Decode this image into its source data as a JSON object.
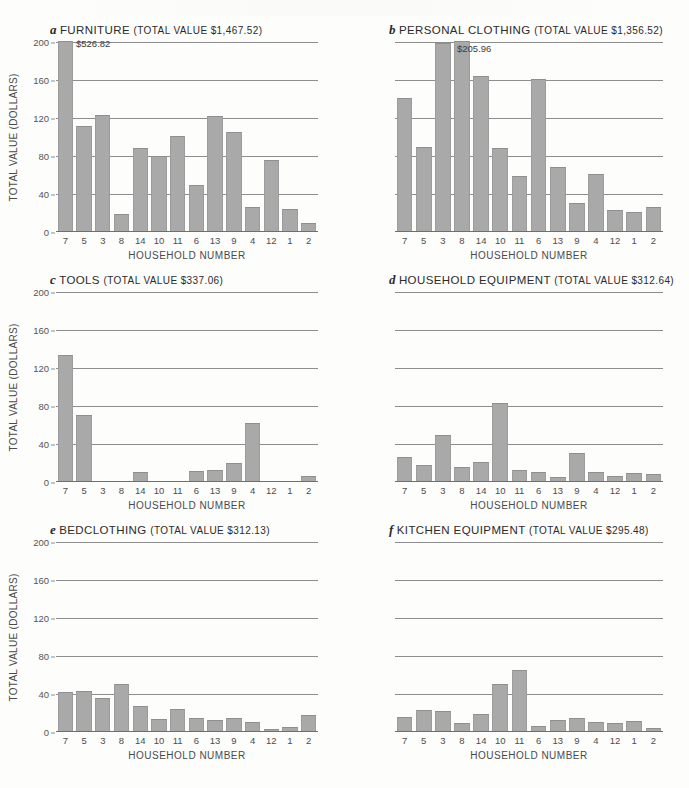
{
  "figure": {
    "x_axis_label": "HOUSEHOLD NUMBER",
    "y_axis_label": "TOTAL VALUE (DOLLARS)",
    "households": [
      "7",
      "5",
      "3",
      "8",
      "14",
      "10",
      "11",
      "6",
      "13",
      "9",
      "4",
      "12",
      "1",
      "2"
    ],
    "y_ticks": [
      "0",
      "40",
      "80",
      "120",
      "160",
      "200"
    ],
    "bar_color": "#a9a9a9",
    "gridline_color": "#8d8d8d"
  },
  "panels": [
    {
      "letter": "a",
      "name": "FURNITURE",
      "total_text": "(TOTAL VALUE $1,467.52)",
      "total_value": "$1,467.52",
      "peak_label": "$526.82",
      "show_y_ticks": true
    },
    {
      "letter": "b",
      "name": "PERSONAL CLOTHING",
      "total_text": "(TOTAL VALUE $1,356.52)",
      "total_value": "$1,356.52",
      "peak_label": "$205.96",
      "show_y_ticks": false
    },
    {
      "letter": "c",
      "name": "TOOLS",
      "total_text": "(TOTAL VALUE $337.06)",
      "total_value": "$337.06",
      "peak_label": "",
      "show_y_ticks": true
    },
    {
      "letter": "d",
      "name": "HOUSEHOLD EQUIPMENT",
      "total_text": "(TOTAL VALUE $312.64)",
      "total_value": "$312.64",
      "peak_label": "",
      "show_y_ticks": false
    },
    {
      "letter": "e",
      "name": "BEDCLOTHING",
      "total_text": "(TOTAL VALUE $312.13)",
      "total_value": "$312.13",
      "peak_label": "",
      "show_y_ticks": true
    },
    {
      "letter": "f",
      "name": "KITCHEN EQUIPMENT",
      "total_text": "(TOTAL VALUE $295.48)",
      "total_value": "$295.48",
      "peak_label": "",
      "show_y_ticks": false
    }
  ],
  "chart_data": [
    {
      "type": "bar",
      "title": "a FURNITURE (TOTAL VALUE $1,467.52)",
      "xlabel": "HOUSEHOLD NUMBER",
      "ylabel": "TOTAL VALUE (DOLLARS)",
      "ylim": [
        0,
        200
      ],
      "yticks": [
        0,
        40,
        80,
        120,
        160,
        200
      ],
      "grid": true,
      "categories": [
        "7",
        "5",
        "3",
        "8",
        "14",
        "10",
        "11",
        "6",
        "13",
        "9",
        "4",
        "12",
        "1",
        "2"
      ],
      "values": [
        205,
        111,
        122,
        18,
        87,
        79,
        100,
        48,
        121,
        104,
        25,
        75,
        23,
        8
      ],
      "annotations": [
        {
          "category": "7",
          "text": "$526.82",
          "note": "bar clipped at axis maximum; true value 526.82"
        }
      ]
    },
    {
      "type": "bar",
      "title": "b PERSONAL CLOTHING (TOTAL VALUE $1,356.52)",
      "xlabel": "HOUSEHOLD NUMBER",
      "ylabel": "TOTAL VALUE (DOLLARS)",
      "ylim": [
        0,
        200
      ],
      "yticks": [
        0,
        40,
        80,
        120,
        160,
        200
      ],
      "grid": true,
      "categories": [
        "7",
        "5",
        "3",
        "8",
        "14",
        "10",
        "11",
        "6",
        "13",
        "9",
        "4",
        "12",
        "1",
        "2"
      ],
      "values": [
        140,
        88,
        198,
        206,
        163,
        87,
        58,
        160,
        67,
        29,
        60,
        22,
        20,
        25
      ],
      "annotations": [
        {
          "category": "8",
          "text": "$205.96",
          "note": "tallest bar, value 205.96"
        }
      ]
    },
    {
      "type": "bar",
      "title": "c TOOLS (TOTAL VALUE $337.06)",
      "xlabel": "HOUSEHOLD NUMBER",
      "ylabel": "TOTAL VALUE (DOLLARS)",
      "ylim": [
        0,
        200
      ],
      "yticks": [
        0,
        40,
        80,
        120,
        160,
        200
      ],
      "grid": true,
      "categories": [
        "7",
        "5",
        "3",
        "8",
        "14",
        "10",
        "11",
        "6",
        "13",
        "9",
        "4",
        "12",
        "1",
        "2"
      ],
      "values": [
        133,
        70,
        0,
        0,
        10,
        0,
        0,
        11,
        12,
        19,
        61,
        0,
        0,
        5
      ],
      "annotations": []
    },
    {
      "type": "bar",
      "title": "d HOUSEHOLD EQUIPMENT (TOTAL VALUE $312.64)",
      "xlabel": "HOUSEHOLD NUMBER",
      "ylabel": "TOTAL VALUE (DOLLARS)",
      "ylim": [
        0,
        200
      ],
      "yticks": [
        0,
        40,
        80,
        120,
        160,
        200
      ],
      "grid": true,
      "categories": [
        "7",
        "5",
        "3",
        "8",
        "14",
        "10",
        "11",
        "6",
        "13",
        "9",
        "4",
        "12",
        "1",
        "2"
      ],
      "values": [
        25,
        17,
        48,
        15,
        20,
        82,
        12,
        10,
        4,
        30,
        9,
        5,
        8,
        7
      ],
      "annotations": []
    },
    {
      "type": "bar",
      "title": "e BEDCLOTHING (TOTAL VALUE $312.13)",
      "xlabel": "HOUSEHOLD NUMBER",
      "ylabel": "TOTAL VALUE (DOLLARS)",
      "ylim": [
        0,
        200
      ],
      "yticks": [
        0,
        40,
        80,
        120,
        160,
        200
      ],
      "grid": true,
      "categories": [
        "7",
        "5",
        "3",
        "8",
        "14",
        "10",
        "11",
        "6",
        "13",
        "9",
        "4",
        "12",
        "1",
        "2"
      ],
      "values": [
        41,
        42,
        35,
        49,
        26,
        13,
        23,
        14,
        12,
        14,
        9,
        2,
        4,
        17
      ],
      "annotations": []
    },
    {
      "type": "bar",
      "title": "f KITCHEN EQUIPMENT (TOTAL VALUE $295.48)",
      "xlabel": "HOUSEHOLD NUMBER",
      "ylabel": "TOTAL VALUE (DOLLARS)",
      "ylim": [
        0,
        200
      ],
      "yticks": [
        0,
        40,
        80,
        120,
        160,
        200
      ],
      "grid": true,
      "categories": [
        "7",
        "5",
        "3",
        "8",
        "14",
        "10",
        "11",
        "6",
        "13",
        "9",
        "4",
        "12",
        "1",
        "2"
      ],
      "values": [
        15,
        22,
        21,
        8,
        18,
        49,
        64,
        5,
        12,
        14,
        9,
        8,
        11,
        3
      ],
      "annotations": []
    }
  ]
}
